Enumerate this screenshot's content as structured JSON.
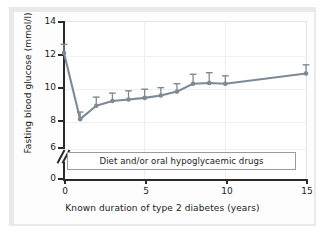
{
  "chart_data": {
    "type": "line",
    "title": "",
    "xlabel": "Known duration of type 2 diabetes (years)",
    "ylabel": "Fasting blood glucose (mmol/l)",
    "xlim": [
      0,
      15
    ],
    "ylim": [
      6,
      14
    ],
    "y_axis_break": true,
    "y_axis_break_between": [
      0,
      6
    ],
    "xticks": [
      0,
      5,
      10,
      15
    ],
    "xtick_labels": [
      "0",
      "5",
      "10",
      "15"
    ],
    "yticks": [
      0,
      6,
      8,
      10,
      12,
      14
    ],
    "ytick_labels": [
      "0",
      "6",
      "8",
      "10",
      "12",
      "14"
    ],
    "grid": true,
    "legend": "none",
    "series": [
      {
        "name": "Fasting blood glucose",
        "color": "#7d8a94",
        "marker": "circle",
        "error_bars": "upper-only",
        "x": [
          0,
          1,
          2,
          3,
          4,
          5,
          6,
          7,
          8,
          9,
          10,
          15
        ],
        "values": [
          12.0,
          7.8,
          8.65,
          8.95,
          9.05,
          9.15,
          9.3,
          9.55,
          10.05,
          10.1,
          10.05,
          10.7
        ],
        "error_upper": [
          0.55,
          0.45,
          0.55,
          0.5,
          0.55,
          0.55,
          0.5,
          0.5,
          0.6,
          0.65,
          0.5,
          0.55
        ]
      }
    ],
    "annotations": [
      {
        "name": "treatment-band",
        "text": "Diet and/or oral hypoglycaemic drugs",
        "x_start": 0,
        "x_end": 15,
        "y": 3.0
      }
    ]
  },
  "axes": {
    "y_title": "Fasting blood glucose (mmol/l)",
    "x_title": "Known duration of type 2 diabetes (years)",
    "y_labels": [
      "14",
      "12",
      "10",
      "8",
      "6",
      "0"
    ],
    "x_labels": [
      "0",
      "5",
      "10",
      "15"
    ]
  },
  "annotation_box": {
    "label": "Diet and/or oral hypoglycaemic drugs"
  },
  "colors": {
    "series": "#7d8a94",
    "axis": "#2a2a2a",
    "plate": "#e9e9e9",
    "plot_background": "#ffffff",
    "grid": "#ededed",
    "text": "#1b1b1b"
  }
}
